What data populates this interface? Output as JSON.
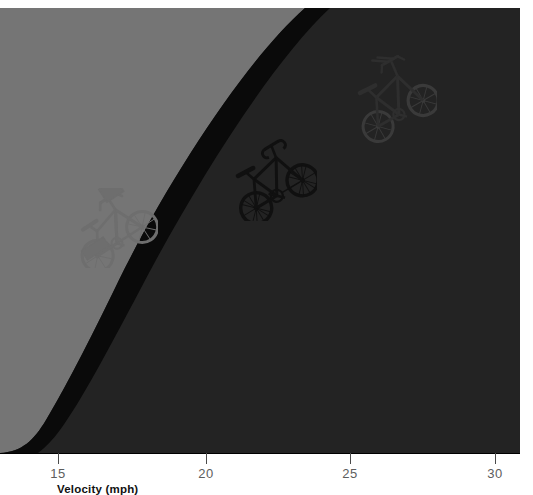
{
  "chart_data": {
    "type": "area",
    "title": "",
    "subtitle": "",
    "xlabel": "Velocity (mph)",
    "ylabel": "",
    "xlim": [
      13.25,
      30.85
    ],
    "ylim": [
      0,
      1
    ],
    "grid": false,
    "legend_position": "none",
    "xticks": [
      15,
      20,
      25,
      30
    ],
    "xtick_labels": [
      "15",
      "20",
      "25",
      "30"
    ],
    "x_pixels": [
      58,
      206,
      350,
      495
    ],
    "bands": [
      {
        "name": "upper-light-band",
        "color": "#757575",
        "role": "region above the black power curve",
        "description": "Light gray region bounded below by the black curve"
      },
      {
        "name": "black-curve-band",
        "color": "#0a0a0a",
        "role": "thick black power curve separating the two gray regions",
        "description": "Black exponential-like band rising steeply toward higher velocity"
      },
      {
        "name": "lower-dark-band",
        "color": "#232323",
        "role": "region below the black power curve",
        "description": "Dark gray region under the curve"
      }
    ],
    "curve_points_upper": [
      {
        "x": 13.25,
        "y": 0.168
      },
      {
        "x": 15,
        "y": 0.214
      },
      {
        "x": 17,
        "y": 0.296
      },
      {
        "x": 19,
        "y": 0.404
      },
      {
        "x": 21,
        "y": 0.545
      },
      {
        "x": 23,
        "y": 0.7
      },
      {
        "x": 25,
        "y": 0.85
      },
      {
        "x": 27,
        "y": 0.96
      },
      {
        "x": 28.3,
        "y": 1.0
      }
    ],
    "curve_points_lower": [
      {
        "x": 13.25,
        "y": 0.138
      },
      {
        "x": 15,
        "y": 0.18
      },
      {
        "x": 17,
        "y": 0.256
      },
      {
        "x": 19,
        "y": 0.356
      },
      {
        "x": 21,
        "y": 0.486
      },
      {
        "x": 23,
        "y": 0.636
      },
      {
        "x": 25,
        "y": 0.786
      },
      {
        "x": 27,
        "y": 0.906
      },
      {
        "x": 29.4,
        "y": 1.0
      }
    ],
    "markers": [
      {
        "name": "city-bike",
        "label": "City / commuter bicycle",
        "color": "#6f6f6f",
        "x": 15.4,
        "y": 0.24,
        "x_pixel": 113,
        "y_pixel": 228
      },
      {
        "name": "road-bike",
        "label": "Road racing bicycle",
        "color": "#111111",
        "x": 21.4,
        "y": 0.56,
        "x_pixel": 272,
        "y_pixel": 180
      },
      {
        "name": "time-trial-bike",
        "label": "Time-trial / aero bicycle",
        "color": "#262626",
        "x": 26.2,
        "y": 0.87,
        "x_pixel": 394,
        "y_pixel": 100
      }
    ]
  },
  "axis": {
    "title": "Velocity (mph)",
    "ticks": [
      {
        "label": "15",
        "x_pixel": 58
      },
      {
        "label": "20",
        "x_pixel": 206
      },
      {
        "label": "25",
        "x_pixel": 350
      },
      {
        "label": "30",
        "x_pixel": 495
      }
    ]
  },
  "colors": {
    "background": "#ffffff",
    "band_light": "#757575",
    "band_black": "#0a0a0a",
    "band_dark": "#232323",
    "axis_line": "#000000",
    "tick_text": "#5d5d5d",
    "title_text": "#111111"
  }
}
